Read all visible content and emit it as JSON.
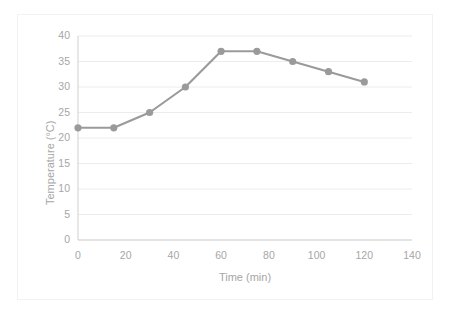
{
  "chart_data": {
    "type": "line",
    "title": "",
    "xlabel": "Time (min)",
    "ylabel": "Temperature (°C)",
    "x": [
      0,
      15,
      30,
      45,
      60,
      75,
      90,
      105,
      120
    ],
    "values": [
      22,
      22,
      25,
      30,
      37,
      37,
      35,
      33,
      31
    ],
    "series": [
      {
        "name": "Temperature",
        "values": [
          22,
          22,
          25,
          30,
          37,
          37,
          35,
          33,
          31
        ]
      }
    ],
    "xlim": [
      0,
      140
    ],
    "ylim": [
      0,
      40
    ],
    "xticks": [
      "0",
      "20",
      "40",
      "60",
      "80",
      "100",
      "120",
      "140"
    ],
    "xtick_values": [
      0,
      20,
      40,
      60,
      80,
      100,
      120,
      140
    ],
    "yticks": [
      "0",
      "5",
      "10",
      "15",
      "20",
      "25",
      "30",
      "35",
      "40"
    ],
    "ytick_values": [
      0,
      5,
      10,
      15,
      20,
      25,
      30,
      35,
      40
    ],
    "grid": "horizontal",
    "legend": "none",
    "line_color": "#9a9a9a",
    "marker_color": "#9a9a9a",
    "gridline_color": "#ececec",
    "axis_color": "#d9d9d9",
    "tick_label_color": "#a6a6a6",
    "frame_color": "#f2f2f2",
    "background": "#ffffff"
  }
}
